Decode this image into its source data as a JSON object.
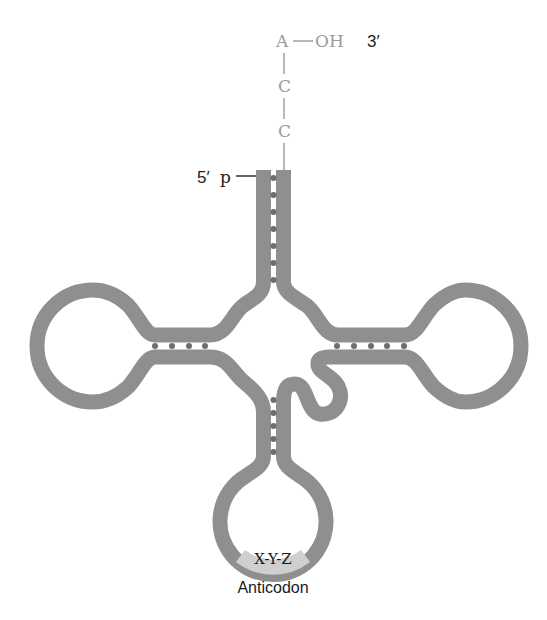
{
  "diagram": {
    "acceptor_end": {
      "bases": [
        "A",
        "C",
        "C"
      ],
      "hydroxyl": "OH",
      "three_prime_label": "3′",
      "five_prime_label": "5′",
      "phosphate_label": "p"
    },
    "anticodon": {
      "sequence": "X-Y-Z",
      "label": "Anticodon"
    },
    "colors": {
      "strand": "#8f8f8f",
      "bond_dot": "#6e6e6e",
      "anticodon_highlight": "#cfcfcf",
      "acceptor_text": "#9a9a9a",
      "label_text": "#222222"
    },
    "base_pairs": {
      "acceptor_stem": 7,
      "d_arm": 4,
      "t_arm": 5,
      "anticodon_stem": 5
    }
  }
}
